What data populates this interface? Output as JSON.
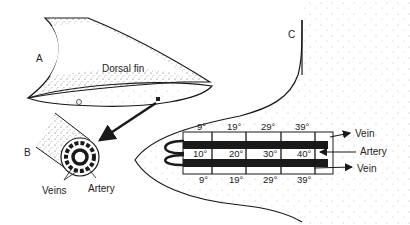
{
  "diagram": {
    "panel_labels": {
      "a": "A",
      "b": "B",
      "c": "C"
    },
    "panel_a": {
      "title": "Dorsal fin"
    },
    "panel_b": {
      "veins_label": "Veins",
      "artery_label": "Artery"
    },
    "panel_c": {
      "vein_top_label": "Vein",
      "artery_label": "Artery",
      "vein_bottom_label": "Vein",
      "top_vein_temps": [
        "9°",
        "19°",
        "29°",
        "39°"
      ],
      "artery_temps": [
        "10°",
        "20°",
        "30°",
        "40°"
      ],
      "bottom_vein_temps": [
        "9°",
        "19°",
        "29°",
        "39°"
      ]
    },
    "colors": {
      "ink": "#1a1a1a",
      "stipple": "#555555",
      "background": "#ffffff"
    }
  }
}
